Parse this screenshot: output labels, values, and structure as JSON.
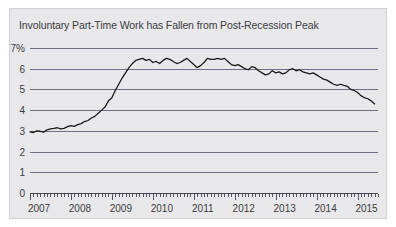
{
  "chart_data": {
    "type": "line",
    "title": "Involuntary Part-Time Work has Fallen from Post-Recession Peak",
    "xlabel": "",
    "ylabel": "",
    "ylim": [
      0,
      7
    ],
    "xlim": [
      2007.0,
      2015.5
    ],
    "grid": true,
    "legend": null,
    "yticks": [
      0,
      1,
      2,
      3,
      4,
      5,
      6,
      7
    ],
    "ytick_labels": [
      "0",
      "1",
      "2",
      "3",
      "4",
      "5",
      "6",
      "7%"
    ],
    "xticks": [
      2007,
      2008,
      2009,
      2010,
      2011,
      2012,
      2013,
      2014,
      2015
    ],
    "xtick_labels": [
      "2007",
      "2008",
      "2009",
      "2010",
      "2011",
      "2012",
      "2013",
      "2014",
      "2015"
    ],
    "line_color": "#1a1a1a",
    "grid_color": "#6f6f86",
    "panel_color": "#e8e8ea",
    "series": [
      {
        "name": "Involuntary part-time work share",
        "x": [
          2007.0,
          2007.083,
          2007.167,
          2007.25,
          2007.333,
          2007.417,
          2007.5,
          2007.583,
          2007.667,
          2007.75,
          2007.833,
          2007.917,
          2008.0,
          2008.083,
          2008.167,
          2008.25,
          2008.333,
          2008.417,
          2008.5,
          2008.583,
          2008.667,
          2008.75,
          2008.833,
          2008.917,
          2009.0,
          2009.083,
          2009.167,
          2009.25,
          2009.333,
          2009.417,
          2009.5,
          2009.583,
          2009.667,
          2009.75,
          2009.833,
          2009.917,
          2010.0,
          2010.083,
          2010.167,
          2010.25,
          2010.333,
          2010.417,
          2010.5,
          2010.583,
          2010.667,
          2010.75,
          2010.833,
          2010.917,
          2011.0,
          2011.083,
          2011.167,
          2011.25,
          2011.333,
          2011.417,
          2011.5,
          2011.583,
          2011.667,
          2011.75,
          2011.833,
          2011.917,
          2012.0,
          2012.083,
          2012.167,
          2012.25,
          2012.333,
          2012.417,
          2012.5,
          2012.583,
          2012.667,
          2012.75,
          2012.833,
          2012.917,
          2013.0,
          2013.083,
          2013.167,
          2013.25,
          2013.333,
          2013.417,
          2013.5,
          2013.583,
          2013.667,
          2013.75,
          2013.833,
          2013.917,
          2014.0,
          2014.083,
          2014.167,
          2014.25,
          2014.333,
          2014.417,
          2014.5,
          2014.583,
          2014.667,
          2014.75,
          2014.833,
          2014.917,
          2015.0,
          2015.083,
          2015.167,
          2015.25,
          2015.333,
          2015.417
        ],
        "values": [
          2.95,
          2.92,
          3.0,
          2.98,
          2.94,
          3.05,
          3.1,
          3.12,
          3.15,
          3.1,
          3.12,
          3.2,
          3.25,
          3.22,
          3.3,
          3.35,
          3.45,
          3.5,
          3.62,
          3.7,
          3.85,
          4.0,
          4.15,
          4.45,
          4.6,
          4.95,
          5.25,
          5.55,
          5.8,
          6.05,
          6.25,
          6.4,
          6.45,
          6.5,
          6.4,
          6.45,
          6.3,
          6.35,
          6.25,
          6.4,
          6.5,
          6.45,
          6.35,
          6.25,
          6.3,
          6.4,
          6.5,
          6.35,
          6.2,
          6.05,
          6.15,
          6.3,
          6.5,
          6.45,
          6.45,
          6.5,
          6.45,
          6.5,
          6.35,
          6.2,
          6.15,
          6.2,
          6.1,
          6.0,
          5.95,
          6.1,
          6.05,
          5.9,
          5.8,
          5.7,
          5.75,
          5.9,
          5.8,
          5.85,
          5.75,
          5.8,
          5.95,
          6.0,
          5.9,
          5.95,
          5.85,
          5.8,
          5.75,
          5.8,
          5.7,
          5.6,
          5.5,
          5.45,
          5.35,
          5.25,
          5.2,
          5.25,
          5.2,
          5.15,
          5.0,
          4.95,
          4.85,
          4.7,
          4.6,
          4.55,
          4.45,
          4.3
        ]
      }
    ]
  }
}
